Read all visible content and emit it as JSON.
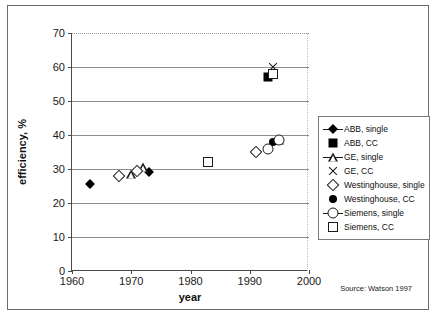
{
  "chart_data": {
    "type": "scatter",
    "title": "",
    "xlabel": "year",
    "ylabel": "efficiency, %",
    "xlim": [
      1960,
      2000
    ],
    "ylim": [
      0,
      70
    ],
    "xticks": [
      "1960",
      "1970",
      "1980",
      "1990",
      "2000"
    ],
    "yticks": [
      "0",
      "10",
      "20",
      "30",
      "40",
      "50",
      "60",
      "70"
    ],
    "grid": "horizontal gridlines at 10,20,30,40,50,60 solid; 70 dotted",
    "legend_position": "right-outside",
    "source": "Source: Watson 1997",
    "series": [
      {
        "name": "ABB, single",
        "marker": "filled-diamond",
        "color": "#000000",
        "points": [
          {
            "x": 1963,
            "y": 25.5
          },
          {
            "x": 1973,
            "y": 29.0
          }
        ]
      },
      {
        "name": "ABB, CC",
        "marker": "filled-square",
        "color": "#000000",
        "points": [
          {
            "x": 1993,
            "y": 57.0
          }
        ]
      },
      {
        "name": "GE, single",
        "marker": "open-triangle",
        "color": "#1a1a1a",
        "points": [
          {
            "x": 1970,
            "y": 28.5
          },
          {
            "x": 1972,
            "y": 30.5
          },
          {
            "x": 1983,
            "y": 32.0
          },
          {
            "x": 1995,
            "y": 38.5
          }
        ]
      },
      {
        "name": "GE, CC",
        "marker": "x-cross",
        "color": "#1a1a1a",
        "points": [
          {
            "x": 1994,
            "y": 60.0
          }
        ]
      },
      {
        "name": "Westinghouse, single",
        "marker": "open-diamond",
        "color": "#1a1a1a",
        "points": [
          {
            "x": 1968,
            "y": 28.0
          },
          {
            "x": 1971,
            "y": 29.5
          },
          {
            "x": 1991,
            "y": 35.0
          }
        ]
      },
      {
        "name": "Westinghouse, CC",
        "marker": "filled-circle",
        "color": "#000000",
        "points": [
          {
            "x": 1994,
            "y": 38.0
          }
        ]
      },
      {
        "name": "Siemens, single",
        "marker": "open-circle",
        "color": "#1a1a1a",
        "points": [
          {
            "x": 1993,
            "y": 36.0
          },
          {
            "x": 1995,
            "y": 38.5
          }
        ]
      },
      {
        "name": "Siemens, CC",
        "marker": "open-square",
        "color": "#1a1a1a",
        "points": [
          {
            "x": 1983,
            "y": 32.0
          },
          {
            "x": 1994,
            "y": 58.0
          }
        ]
      }
    ]
  }
}
